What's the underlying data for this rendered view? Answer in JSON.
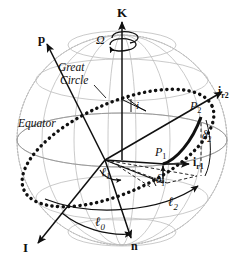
{
  "figure": {
    "type": "celestial-sphere-orbit-geometry-diagram",
    "background_color": "#ffffff",
    "ink_color": "#101010",
    "grid_color": "#b9b9b9",
    "width": 246,
    "height": 274
  },
  "labels": {
    "k_axis": "K",
    "omega": "Ω",
    "p_vector": "p",
    "i_vector": "I",
    "n_vector": "n",
    "great_circle": "Great",
    "great_circle_line2": "Circle",
    "equator": "Equator",
    "inclination": "i",
    "point_1": "P",
    "point_1_sub": "1",
    "point_2": "P",
    "point_2_sub": "2",
    "i_r1": "i",
    "i_r1_sub": "r1",
    "i_r2": "i",
    "i_r2_sub": "r2",
    "delta_1": "δ",
    "delta_1_sub": "1",
    "delta_2": "δ",
    "delta_2_sub": "2",
    "ell_0": "ℓ",
    "ell_0_sub": "0",
    "ell_1": "ℓ",
    "ell_1_sub": "1",
    "ell_2": "ℓ",
    "ell_2_sub": "2"
  },
  "geometry": {
    "sphere_center_x": 122,
    "sphere_center_y": 140,
    "sphere_radius": 105,
    "origin_x": 105,
    "origin_y": 160,
    "point_1_x": 163,
    "point_1_y": 166,
    "point_2_x": 201,
    "point_2_y": 118
  }
}
